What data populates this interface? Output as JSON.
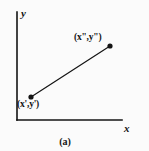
{
  "figure": {
    "caption": "(a)",
    "background_color": "#fbfbfb",
    "ink_color": "#141414"
  },
  "axes": {
    "x_label": "x",
    "y_label": "y",
    "origin": {
      "x": 17,
      "y": 120
    },
    "x_axis_end": {
      "x": 122,
      "y": 120
    },
    "y_axis_end": {
      "x": 17,
      "y": 12
    },
    "line_width": 1.6
  },
  "points": [
    {
      "name": "lower-left-point",
      "label": "(x',y')",
      "label_x_var": "x",
      "label_x_prime": "'",
      "label_y_var": "y",
      "label_y_prime": "'",
      "cx": 31,
      "cy": 97,
      "radius": 2.6
    },
    {
      "name": "upper-right-point",
      "label": "(x\",y\")",
      "label_x_var": "x",
      "label_x_prime": "\"",
      "label_y_var": "y",
      "label_y_prime": "\"",
      "cx": 110,
      "cy": 46,
      "radius": 2.6
    }
  ],
  "segment": {
    "from": {
      "x": 31,
      "y": 97
    },
    "to": {
      "x": 110,
      "y": 46
    },
    "line_width": 1.2,
    "color": "#141414"
  },
  "chart_data": {
    "type": "scatter",
    "title": "(a)",
    "xlabel": "x",
    "ylabel": "y",
    "grid": false,
    "legend": null,
    "annotations": [
      "(x',y')",
      "(x\",y\")"
    ],
    "series": [
      {
        "name": "line-segment",
        "points": [
          {
            "label": "(x',y')",
            "px": 31,
            "py": 97
          },
          {
            "label": "(x\",y\")",
            "px": 110,
            "py": 46
          }
        ]
      }
    ]
  }
}
